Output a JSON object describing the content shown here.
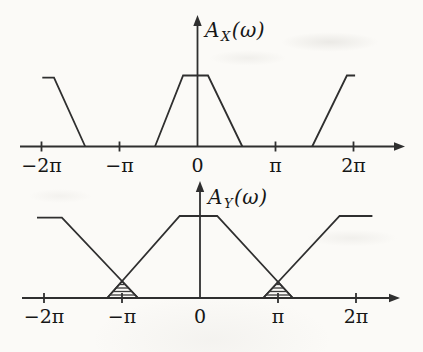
{
  "figure": {
    "background": "#fbfaf7",
    "line_color": "#2f2f2f",
    "hatch_color": "#3a3a3a",
    "text_color": "#161616"
  },
  "chart_data": [
    {
      "type": "line",
      "name": "input-amplitude-spectrum",
      "title": "A_X(w)",
      "y_axis_title": {
        "base": "A",
        "sub": "X",
        "suffix": "(ω)"
      },
      "x_unit": "pi_radians",
      "xlim": [
        -2.35,
        2.65
      ],
      "ylim": [
        0,
        1.35
      ],
      "grid": false,
      "x_ticks": [
        {
          "value": -2,
          "label": "−2π"
        },
        {
          "value": -1,
          "label": "−π"
        },
        {
          "value": 0,
          "label": "0"
        },
        {
          "value": 1,
          "label": "π"
        },
        {
          "value": 2,
          "label": "2π"
        }
      ],
      "series": [
        {
          "name": "replica-left",
          "points": [
            [
              -1.99,
              0.97
            ],
            [
              -1.84,
              0.97
            ],
            [
              -1.44,
              0
            ]
          ]
        },
        {
          "name": "main-lobe",
          "points": [
            [
              -0.545,
              0
            ],
            [
              -0.185,
              1
            ],
            [
              0.135,
              1
            ],
            [
              0.575,
              0
            ]
          ]
        },
        {
          "name": "replica-right",
          "points": [
            [
              1.47,
              0
            ],
            [
              1.915,
              1
            ],
            [
              2.02,
              1
            ]
          ]
        }
      ],
      "hatched_regions": []
    },
    {
      "type": "line",
      "name": "output-amplitude-spectrum",
      "title": "A_Y(w)",
      "y_axis_title": {
        "base": "A",
        "sub": "Y",
        "suffix": "(ω)"
      },
      "x_unit": "pi_radians",
      "xlim": [
        -2.35,
        2.65
      ],
      "ylim": [
        0,
        1.25
      ],
      "grid": false,
      "x_ticks": [
        {
          "value": -2,
          "label": "−2π"
        },
        {
          "value": -1,
          "label": "−π"
        },
        {
          "value": 0,
          "label": "0"
        },
        {
          "value": 1,
          "label": "π"
        },
        {
          "value": 2,
          "label": "2π"
        }
      ],
      "series": [
        {
          "name": "replica-left",
          "points": [
            [
              -2.09,
              0.98
            ],
            [
              -1.77,
              0.98
            ],
            [
              -0.795,
              0
            ]
          ]
        },
        {
          "name": "main-lobe",
          "points": [
            [
              -1.19,
              0
            ],
            [
              -0.26,
              1
            ],
            [
              0.22,
              1
            ],
            [
              1.19,
              0
            ]
          ]
        },
        {
          "name": "replica-right",
          "points": [
            [
              0.81,
              0
            ],
            [
              1.79,
              1
            ],
            [
              2.21,
              1
            ]
          ]
        }
      ],
      "hatched_regions": [
        {
          "name": "aliasing-overlap-left",
          "points": [
            [
              -1.19,
              0
            ],
            [
              -0.999,
              0.205
            ],
            [
              -0.795,
              0
            ]
          ]
        },
        {
          "name": "aliasing-overlap-right",
          "points": [
            [
              0.81,
              0
            ],
            [
              1.001,
              0.195
            ],
            [
              1.19,
              0
            ]
          ]
        }
      ]
    }
  ]
}
